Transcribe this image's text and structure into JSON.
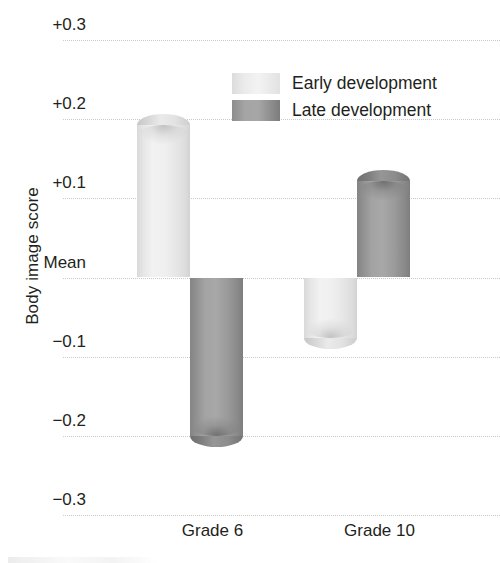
{
  "chart_data": {
    "type": "bar",
    "title": "",
    "subtitle": "",
    "xlabel": "",
    "ylabel": "Body image score",
    "categories": [
      "Grade 6",
      "Grade 10"
    ],
    "series": [
      {
        "name": "Early development",
        "values": [
          0.193,
          -0.076
        ],
        "color": "#eeeeee"
      },
      {
        "name": "Late development",
        "values": [
          -0.2,
          0.122
        ],
        "color": "#9b9b9b"
      }
    ],
    "ylim": [
      -0.3,
      0.3
    ],
    "ytick_values": [
      0.3,
      0.2,
      0.1,
      0.0,
      -0.1,
      -0.2,
      -0.3
    ],
    "ytick_labels": [
      "+0.3",
      "+0.2",
      "+0.1",
      "Mean",
      "−0.1",
      "−0.2",
      "−0.3"
    ],
    "grid": true,
    "grid_style": "dotted",
    "grid_color": "#c9c9c9",
    "legend_position": "top-center",
    "baseline_label": "Mean",
    "annotations": []
  },
  "legend": {
    "items": [
      {
        "label": "Early development",
        "swatch": "light-gray-gradient"
      },
      {
        "label": "Late development",
        "swatch": "dark-gray-gradient"
      }
    ]
  },
  "axes": {
    "y_title": "Body image score",
    "y_ticks": [
      {
        "label": "+0.3",
        "value": 0.3
      },
      {
        "label": "+0.2",
        "value": 0.2
      },
      {
        "label": "+0.1",
        "value": 0.1
      },
      {
        "label": "Mean",
        "value": 0.0
      },
      {
        "label": "−0.1",
        "value": -0.1
      },
      {
        "label": "−0.2",
        "value": -0.2
      },
      {
        "label": "−0.3",
        "value": -0.3
      }
    ],
    "x_categories": [
      {
        "label": "Grade 6"
      },
      {
        "label": "Grade 10"
      }
    ]
  }
}
